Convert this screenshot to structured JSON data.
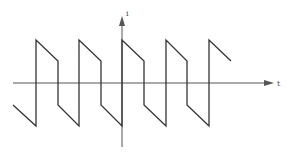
{
  "diagram": {
    "type": "waveform",
    "x_axis_label": "t",
    "y_axis_label": "i",
    "colors": {
      "line": "#333333",
      "axis": "#555555"
    },
    "axis": {
      "origin": [
        122,
        83
      ],
      "x_start": 13,
      "x_end": 273,
      "y_top": 17,
      "y_bottom": 147
    },
    "waveform_points": [
      [
        13,
        105
      ],
      [
        36,
        126
      ],
      [
        36,
        40
      ],
      [
        58,
        61
      ],
      [
        58,
        105
      ],
      [
        79,
        126
      ],
      [
        79,
        40
      ],
      [
        101,
        61
      ],
      [
        101,
        105
      ],
      [
        122,
        126
      ],
      [
        122,
        40
      ],
      [
        144,
        61
      ],
      [
        144,
        105
      ],
      [
        166,
        126
      ],
      [
        166,
        40
      ],
      [
        187,
        61
      ],
      [
        187,
        105
      ],
      [
        209,
        126
      ],
      [
        209,
        40
      ],
      [
        231,
        61
      ]
    ]
  }
}
